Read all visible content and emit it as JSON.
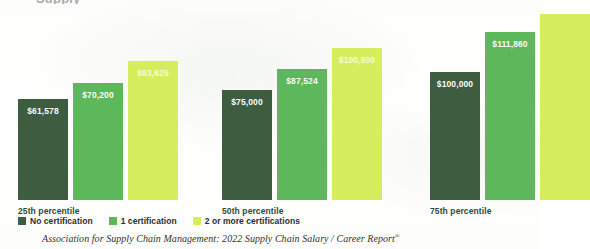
{
  "page_title_partial": "Supply",
  "chart_data": {
    "type": "bar",
    "xlabel": "",
    "ylabel": "",
    "grid": false,
    "legend_position": "bottom-left",
    "ylim": [
      0,
      125000
    ],
    "categories": [
      "25th percentile",
      "50th percentile",
      "75th percentile"
    ],
    "series": [
      {
        "name": "No certification",
        "color": "#3e5c40",
        "values": [
          61578,
          70200,
          83625
        ],
        "labels": [
          "$61,578",
          "$70,200",
          "$83,625"
        ]
      },
      {
        "name": "1 certification",
        "color": "#5cb85a",
        "values": [
          75000,
          87524,
          100500
        ],
        "labels": [
          "$75,000",
          "$87,524",
          "$100,500"
        ]
      },
      {
        "name": "2 or more certifications",
        "color": "#d6ed5e",
        "values": [
          100000,
          111860,
          null
        ],
        "labels": [
          "$100,000",
          "$111,860",
          ""
        ]
      }
    ],
    "groups": [
      {
        "category": "25th percentile",
        "bars": [
          {
            "series": "No certification",
            "color": "#3e5c40",
            "value": 61578,
            "label": "$61,578",
            "height_px": 101,
            "truncated": false
          },
          {
            "series": "1 certification",
            "color": "#5cb85a",
            "value": 70200,
            "label": "$70,200",
            "height_px": 117,
            "truncated": false
          },
          {
            "series": "2 or more certifications",
            "color": "#d6ed5e",
            "value": 83625,
            "label": "$83,625",
            "height_px": 139,
            "truncated": false
          }
        ]
      },
      {
        "category": "50th percentile",
        "bars": [
          {
            "series": "No certification",
            "color": "#3e5c40",
            "value": 75000,
            "label": "$75,000",
            "height_px": 110,
            "truncated": false
          },
          {
            "series": "1 certification",
            "color": "#5cb85a",
            "value": 87524,
            "label": "$87,524",
            "height_px": 131,
            "truncated": false
          },
          {
            "series": "2 or more certifications",
            "color": "#d6ed5e",
            "value": 100500,
            "label": "$100,500",
            "height_px": 152,
            "truncated": false
          }
        ]
      },
      {
        "category": "75th percentile",
        "bars": [
          {
            "series": "No certification",
            "color": "#3e5c40",
            "value": 100000,
            "label": "$100,000",
            "height_px": 128,
            "truncated": false
          },
          {
            "series": "1 certification",
            "color": "#5cb85a",
            "value": 111860,
            "label": "$111,860",
            "height_px": 168,
            "truncated": false
          },
          {
            "series": "2 or more certifications",
            "color": "#d6ed5e",
            "value": null,
            "label": "",
            "height_px": 186,
            "truncated": true
          }
        ]
      }
    ]
  },
  "legend": {
    "items": [
      {
        "label": "No certification",
        "color": "#3e5c40"
      },
      {
        "label": "1 certification",
        "color": "#5cb85a"
      },
      {
        "label": "2 or more certifications",
        "color": "#d6ed5e"
      }
    ]
  },
  "source": {
    "text": "Association for Supply Chain Management: 2022 Supply Chain Salary / Career Report",
    "superscript": "®"
  },
  "colors": {
    "no_certification": "#3e5c40",
    "one_certification": "#5cb85a",
    "two_or_more_certifications": "#d6ed5e",
    "category_label": "#2f4a33",
    "background": "#ffffff"
  }
}
